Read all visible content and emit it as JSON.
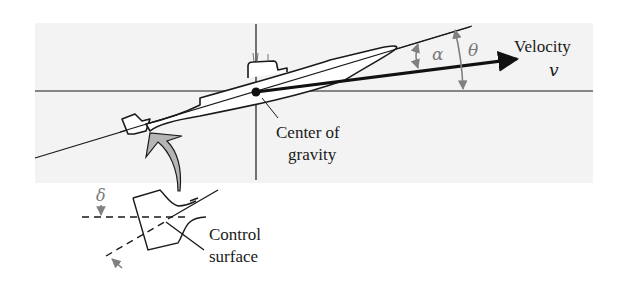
{
  "diagram": {
    "panel_color": "#f3f3f3",
    "line_color": "#1a1a1a",
    "annotation_color": "#808080",
    "arrow_fill": "#b5b5b5",
    "labels": {
      "velocity": "Velocity",
      "velocity_symbol": "v",
      "alpha": "α",
      "theta": "θ",
      "delta": "δ",
      "cg_line1": "Center of",
      "cg_line2": "gravity",
      "control_line1": "Control",
      "control_line2": "surface"
    }
  }
}
